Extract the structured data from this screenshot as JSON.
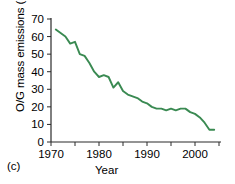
{
  "panel_label": "(c)",
  "axis": {
    "y_title_main": "O/G mass emissions (10",
    "y_title_exp": "3",
    "y_title_tail": " mt)",
    "x_title": "Year"
  },
  "chart_data": {
    "type": "line",
    "title": "",
    "xlabel": "Year",
    "ylabel": "O/G mass emissions (10^3 mt)",
    "xlim": [
      1968,
      2005
    ],
    "ylim": [
      0,
      70
    ],
    "xticks": [
      1970,
      1975,
      1980,
      1985,
      1990,
      1995,
      2000,
      2005
    ],
    "xticklabels": [
      "1970",
      "",
      "1980",
      "",
      "1990",
      "",
      "2000",
      ""
    ],
    "yticks": [
      0,
      10,
      20,
      30,
      40,
      50,
      60,
      70
    ],
    "yticklabels": [
      "0",
      "10",
      "20",
      "30",
      "40",
      "50",
      "60",
      "70"
    ],
    "grid": false,
    "legend": null,
    "line_color": "#3a8a52",
    "x": [
      1971,
      1972,
      1973,
      1974,
      1975,
      1976,
      1977,
      1978,
      1979,
      1980,
      1981,
      1982,
      1983,
      1984,
      1985,
      1986,
      1987,
      1988,
      1989,
      1990,
      1991,
      1992,
      1993,
      1994,
      1995,
      1996,
      1997,
      1998,
      1999,
      2000,
      2001,
      2002,
      2003,
      2004
    ],
    "values": [
      64,
      62,
      60,
      56,
      57,
      50,
      49,
      45,
      40,
      37,
      38,
      37,
      31,
      34,
      29,
      27,
      26,
      25,
      23,
      22,
      20,
      19,
      19,
      18,
      19,
      18,
      19,
      19,
      17,
      16,
      14,
      11,
      7,
      7
    ]
  }
}
